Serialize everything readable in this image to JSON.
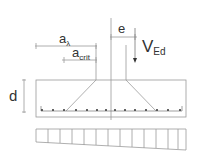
{
  "diagram": {
    "type": "punching shear footing section",
    "labels": {
      "a_lambda": {
        "base": "a",
        "sub": "λ"
      },
      "a_crit": {
        "base": "a",
        "sub": "crit"
      },
      "eccentricity": "e",
      "load": {
        "base": "V",
        "sub": "Ed"
      },
      "depth": "d"
    },
    "colors": {
      "line": "#9a9a9a",
      "dark_line": "#555555",
      "text": "#333333",
      "rebar": "#333333"
    },
    "rebar_count": 14,
    "pressure_cells": 13
  }
}
